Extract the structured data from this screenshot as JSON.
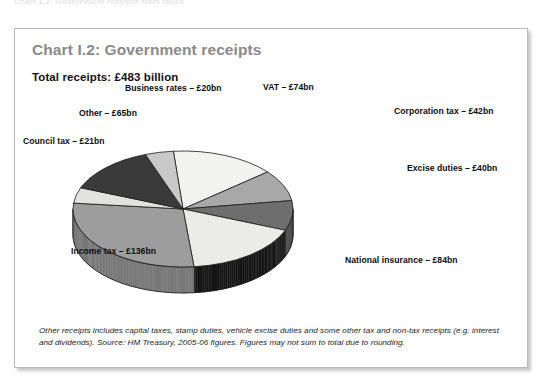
{
  "page": {
    "cropped_header_text": "Chart 1.2: Government receipts from taxes"
  },
  "chart_panel": {
    "title": "Chart I.2: Government receipts",
    "subtitle": "Total receipts: £483 billion",
    "footnote": "Other receipts includes capital taxes, stamp duties, vehicle excise duties and some other tax and non-tax receipts (e.g. interest and dividends). Source: HM Treasury, 2005-06 figures. Figures may not sum to total due to rounding.",
    "title_color": "#8a8a8a",
    "subtitle_color": "#111111",
    "border_color": "#b9b9b9"
  },
  "chart_data": {
    "type": "pie",
    "title": "Chart I.2: Government receipts",
    "subtitle": "Total receipts: £483 billion",
    "unit": "£ billion",
    "total": 483,
    "three_d": true,
    "legend": "none",
    "labels_position": "outside-callout",
    "categories": [
      "VAT",
      "Corporation tax",
      "Excise duties",
      "National insurance",
      "Income tax",
      "Council tax",
      "Other",
      "Business rates"
    ],
    "values": [
      74,
      42,
      40,
      84,
      136,
      21,
      65,
      20
    ],
    "value_labels": [
      "VAT – £74bn",
      "Corporation tax – £42bn",
      "Excise duties – £40bn",
      "National insurance – £84bn",
      "Income tax – £136bn",
      "Council tax – £21bn",
      "Other – £65bn",
      "Business rates – £20bn"
    ],
    "slice_colors": [
      "#f2f2f0",
      "#a8a8a8",
      "#6e6e6e",
      "#ebebe8",
      "#9d9d9d",
      "#e2e2e0",
      "#3a3a3a",
      "#c9c9c9"
    ],
    "side_colors": [
      "#bdbdbd",
      "#7d7d7d",
      "#4d4d4d",
      "#151515",
      "#777777",
      "#a9a9a9",
      "#262626",
      "#969696"
    ]
  },
  "labels": {
    "business_rates": "Business rates – £20bn",
    "vat": "VAT – £74bn",
    "corporation_tax": "Corporation tax – £42bn",
    "excise_duties": "Excise duties – £40bn",
    "national_insurance": "National insurance – £84bn",
    "income_tax": "Income tax – £136bn",
    "council_tax": "Council tax – £21bn",
    "other": "Other – £65bn"
  }
}
